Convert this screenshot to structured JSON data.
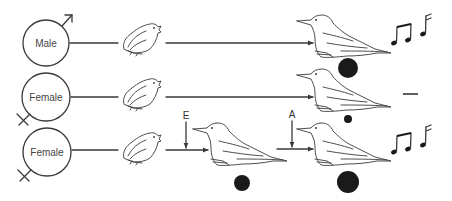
{
  "diagram": {
    "rows": [
      {
        "sex_label": "Male",
        "sex_symbol": "male-symbol",
        "stages": [
          "juvenile",
          "adult"
        ],
        "nucleus_size": "large",
        "outcome": "sings"
      },
      {
        "sex_label": "Female",
        "sex_symbol": "female-symbol",
        "stages": [
          "juvenile",
          "adult"
        ],
        "nucleus_size": "small",
        "outcome": "no song"
      },
      {
        "sex_label": "Female",
        "sex_symbol": "female-symbol",
        "stages": [
          "juvenile",
          "intermediate",
          "adult"
        ],
        "treatments": [
          {
            "label": "E",
            "position": "before intermediate"
          },
          {
            "label": "A",
            "position": "before adult"
          }
        ],
        "nucleus_sizes": [
          "medium",
          "large"
        ],
        "outcome": "sings"
      }
    ],
    "colors": {
      "ink": "#1a1a1a",
      "line": "#3a3a3a",
      "background": "#ffffff"
    }
  }
}
